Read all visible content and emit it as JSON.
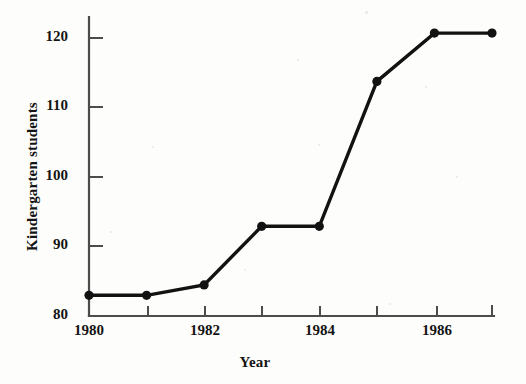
{
  "figure": {
    "background_color": "#fdfdfb",
    "ink_color": "#121212"
  },
  "chart_data": {
    "type": "line",
    "title": "",
    "xlabel": "Year",
    "ylabel": "Kindergarten students",
    "x": [
      1980,
      1981,
      1982,
      1983,
      1984,
      1985,
      1986,
      1987
    ],
    "values": [
      83,
      83,
      84.5,
      93,
      93,
      114,
      121,
      121
    ],
    "series": [
      {
        "name": "Kindergarten students",
        "values": [
          83,
          83,
          84.5,
          93,
          93,
          114,
          121,
          121
        ],
        "line_color": "#121212",
        "marker": "filled-circle",
        "marker_color": "#121212"
      }
    ],
    "xlim": [
      1980,
      1987
    ],
    "ylim": [
      80,
      121.5
    ],
    "x_tick_values": [
      1980,
      1981,
      1982,
      1983,
      1984,
      1985,
      1986,
      1987
    ],
    "x_tick_labels": [
      "1980",
      "",
      "1982",
      "",
      "1984",
      "",
      "1986",
      ""
    ],
    "y_ticks": [
      80,
      90,
      100,
      110,
      120
    ],
    "y_tick_labels": [
      "80",
      "90",
      "100",
      "110",
      "120"
    ],
    "grid": false,
    "legend": false,
    "legend_position": "none"
  },
  "axes": {
    "y_title": "Kindergarten students",
    "x_title": "Year",
    "y_tick_labels": {
      "t120": "120",
      "t110": "110",
      "t100": "100",
      "t90": "90",
      "t80": "80"
    },
    "x_tick_labels": {
      "t1980": "1980",
      "t1982": "1982",
      "t1984": "1984",
      "t1986": "1986"
    }
  }
}
